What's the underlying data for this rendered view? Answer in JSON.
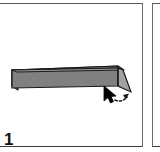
{
  "panel": {
    "step_number": "1",
    "background_color": "#ffffff",
    "border_color": "#585858"
  },
  "figure": {
    "name": "beveled-bar-3d",
    "top_face_color": "#8e8e8e",
    "front_face_color": "#7c7c7c",
    "bevel_face_color": "#a0a0a0",
    "outline_color": "#1a1a1a",
    "left_x": 10,
    "right_x": 132,
    "top_y": 58,
    "bottom_y": 88
  },
  "cursor": {
    "pointer_icon": "mouse-pointer-icon",
    "gesture_icon": "dashed-rotate-arrow-icon",
    "pointer_color": "#000000",
    "gesture_color": "#1a1a1a",
    "x": 105,
    "y": 84
  },
  "next_panel": {
    "label": ""
  }
}
